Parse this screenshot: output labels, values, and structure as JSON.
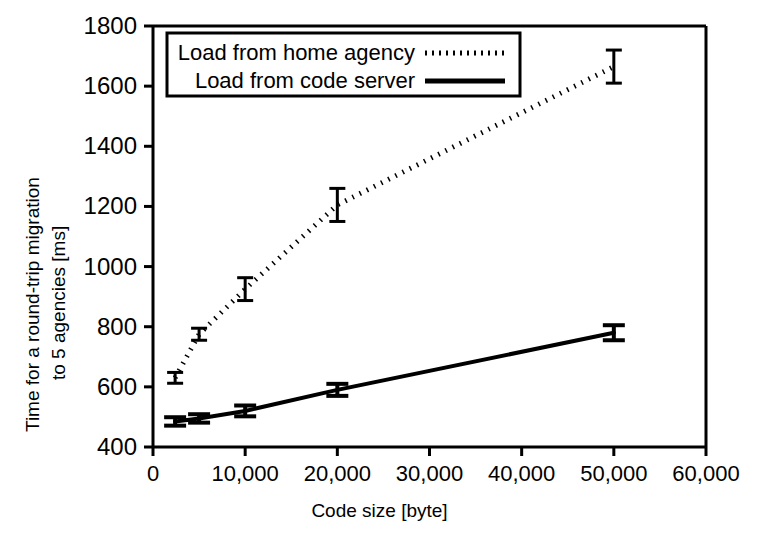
{
  "chart_data": {
    "type": "line",
    "title": "",
    "xlabel": "Code size [byte]",
    "ylabel_line1": "Time for a round-trip migration",
    "ylabel_line2": "to 5 agencies [ms]",
    "xlim": [
      0,
      60000
    ],
    "ylim": [
      400,
      1800
    ],
    "xticks": [
      0,
      10000,
      20000,
      30000,
      40000,
      50000,
      60000
    ],
    "xtick_labels": [
      "0",
      "10,000",
      "20,000",
      "30,000",
      "40,000",
      "50,000",
      "60,000"
    ],
    "yticks": [
      400,
      600,
      800,
      1000,
      1200,
      1400,
      1600,
      1800
    ],
    "ytick_labels": [
      "400",
      "600",
      "800",
      "1000",
      "1200",
      "1400",
      "1600",
      "1800"
    ],
    "grid": false,
    "legend_position": "top-left-inside",
    "x": [
      2400,
      5000,
      10000,
      20000,
      50000
    ],
    "series": [
      {
        "name": "Load from home agency",
        "style": "dotted",
        "color": "#000000",
        "values": [
          630,
          775,
          925,
          1205,
          1665
        ],
        "errors": [
          18,
          20,
          38,
          55,
          55
        ]
      },
      {
        "name": "Load from code server",
        "style": "solid",
        "color": "#000000",
        "values": [
          485,
          495,
          520,
          590,
          780
        ],
        "errors": [
          14,
          14,
          18,
          20,
          25
        ]
      }
    ]
  },
  "legend": {
    "entries": [
      {
        "label": "Load from home agency",
        "style": "dotted"
      },
      {
        "label": "Load from code server",
        "style": "solid"
      }
    ]
  },
  "colors": {
    "axis": "#000000",
    "background": "#ffffff",
    "ink": "#000000"
  }
}
